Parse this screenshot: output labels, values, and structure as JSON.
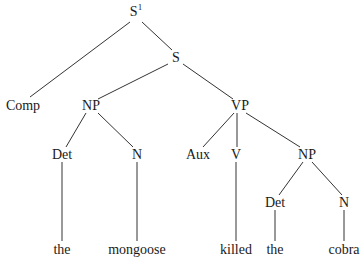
{
  "diagram": {
    "type": "syntax-tree",
    "root": {
      "label": "S",
      "superscript": "1"
    },
    "nodes": {
      "s1": {
        "label": "S",
        "sup": "1",
        "x": 136,
        "y": 12
      },
      "s": {
        "label": "S",
        "x": 176,
        "y": 58
      },
      "comp": {
        "label": "Comp",
        "x": 23,
        "y": 106
      },
      "np1": {
        "label": "NP",
        "x": 91,
        "y": 106
      },
      "vp": {
        "label": "VP",
        "x": 240,
        "y": 106
      },
      "det1": {
        "label": "Det",
        "x": 62,
        "y": 155
      },
      "n1": {
        "label": "N",
        "x": 137,
        "y": 155
      },
      "aux": {
        "label": "Aux",
        "x": 198,
        "y": 155
      },
      "v": {
        "label": "V",
        "x": 236,
        "y": 155
      },
      "np2": {
        "label": "NP",
        "x": 307,
        "y": 155
      },
      "det2": {
        "label": "Det",
        "x": 275,
        "y": 203
      },
      "n2": {
        "label": "N",
        "x": 344,
        "y": 203
      },
      "w_the1": {
        "label": "the",
        "x": 62,
        "y": 250
      },
      "w_mongoose": {
        "label": "mongoose",
        "x": 137,
        "y": 250
      },
      "w_killed": {
        "label": "killed",
        "x": 236,
        "y": 250
      },
      "w_the2": {
        "label": "the",
        "x": 275,
        "y": 250
      },
      "w_cobra": {
        "label": "cobra",
        "x": 344,
        "y": 250
      }
    },
    "edges": [
      [
        "s1",
        "comp"
      ],
      [
        "s1",
        "s"
      ],
      [
        "s",
        "np1"
      ],
      [
        "s",
        "vp"
      ],
      [
        "np1",
        "det1"
      ],
      [
        "np1",
        "n1"
      ],
      [
        "vp",
        "aux"
      ],
      [
        "vp",
        "v"
      ],
      [
        "vp",
        "np2"
      ],
      [
        "np2",
        "det2"
      ],
      [
        "np2",
        "n2"
      ],
      [
        "det1",
        "w_the1"
      ],
      [
        "n1",
        "w_mongoose"
      ],
      [
        "v",
        "w_killed"
      ],
      [
        "det2",
        "w_the2"
      ],
      [
        "n2",
        "w_cobra"
      ]
    ],
    "sentence": "the mongoose killed the cobra"
  }
}
